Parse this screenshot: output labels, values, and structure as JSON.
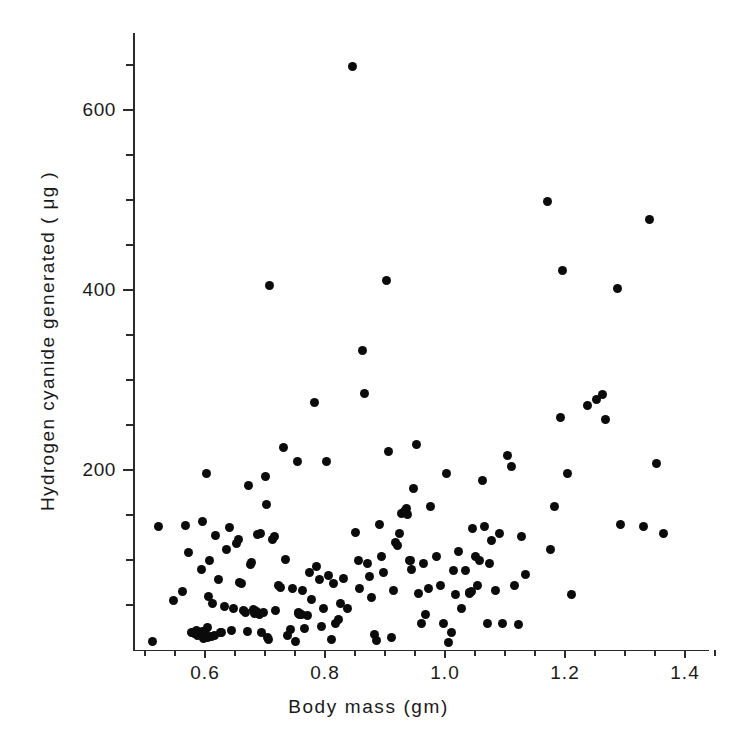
{
  "chart_data": {
    "type": "scatter",
    "title": "",
    "xlabel": "Body mass (gm)",
    "ylabel": "Hydrogen cyanide generated ( μg )",
    "xlim": [
      0.49,
      1.455
    ],
    "ylim": [
      0,
      686
    ],
    "grid": false,
    "legend": null,
    "x_ticks_major": [
      0.6,
      0.8,
      1.0,
      1.2,
      1.4
    ],
    "x_tick_labels": [
      "0.6",
      "0.8",
      "1.0",
      "1.2",
      "1.4"
    ],
    "x_ticks_minor": [
      0.5,
      0.55,
      0.65,
      0.7,
      0.75,
      0.85,
      0.9,
      0.95,
      1.05,
      1.1,
      1.15,
      1.25,
      1.3,
      1.35,
      1.45
    ],
    "y_ticks_major": [
      200,
      400,
      600
    ],
    "y_tick_labels": [
      "200",
      "400",
      "600"
    ],
    "y_ticks_minor": [
      50,
      100,
      150,
      250,
      300,
      350,
      450,
      500,
      550,
      650
    ],
    "marker": "filled-circle",
    "marker_color": "#0b0b0b",
    "marker_size_px": 9,
    "n_points": 176,
    "points": [
      [
        0.513,
        10
      ],
      [
        0.523,
        137
      ],
      [
        0.547,
        55
      ],
      [
        0.562,
        65
      ],
      [
        0.568,
        138
      ],
      [
        0.572,
        108
      ],
      [
        0.578,
        20
      ],
      [
        0.583,
        18
      ],
      [
        0.585,
        22
      ],
      [
        0.588,
        16
      ],
      [
        0.592,
        20
      ],
      [
        0.594,
        90
      ],
      [
        0.596,
        143
      ],
      [
        0.598,
        13
      ],
      [
        0.6,
        18
      ],
      [
        0.602,
        196
      ],
      [
        0.604,
        25
      ],
      [
        0.606,
        60
      ],
      [
        0.608,
        100
      ],
      [
        0.61,
        15
      ],
      [
        0.612,
        52
      ],
      [
        0.615,
        16
      ],
      [
        0.618,
        127
      ],
      [
        0.622,
        78
      ],
      [
        0.628,
        20
      ],
      [
        0.632,
        48
      ],
      [
        0.636,
        112
      ],
      [
        0.64,
        136
      ],
      [
        0.644,
        22
      ],
      [
        0.648,
        46
      ],
      [
        0.652,
        118
      ],
      [
        0.656,
        123
      ],
      [
        0.66,
        74
      ],
      [
        0.664,
        44
      ],
      [
        0.668,
        42
      ],
      [
        0.67,
        21
      ],
      [
        0.672,
        183
      ],
      [
        0.676,
        95
      ],
      [
        0.678,
        97
      ],
      [
        0.68,
        45
      ],
      [
        0.684,
        43
      ],
      [
        0.688,
        128
      ],
      [
        0.69,
        40
      ],
      [
        0.692,
        130
      ],
      [
        0.694,
        20
      ],
      [
        0.697,
        42
      ],
      [
        0.7,
        193
      ],
      [
        0.702,
        162
      ],
      [
        0.704,
        14
      ],
      [
        0.706,
        12
      ],
      [
        0.708,
        405
      ],
      [
        0.712,
        123
      ],
      [
        0.716,
        126
      ],
      [
        0.718,
        44
      ],
      [
        0.722,
        72
      ],
      [
        0.726,
        70
      ],
      [
        0.73,
        225
      ],
      [
        0.734,
        101
      ],
      [
        0.738,
        16
      ],
      [
        0.742,
        23
      ],
      [
        0.746,
        68
      ],
      [
        0.75,
        10
      ],
      [
        0.754,
        210
      ],
      [
        0.756,
        42
      ],
      [
        0.758,
        40
      ],
      [
        0.762,
        66
      ],
      [
        0.766,
        24
      ],
      [
        0.77,
        38
      ],
      [
        0.774,
        86
      ],
      [
        0.778,
        56
      ],
      [
        0.782,
        275
      ],
      [
        0.786,
        93
      ],
      [
        0.79,
        78
      ],
      [
        0.794,
        26
      ],
      [
        0.798,
        46
      ],
      [
        0.802,
        210
      ],
      [
        0.806,
        83
      ],
      [
        0.81,
        12
      ],
      [
        0.814,
        74
      ],
      [
        0.818,
        30
      ],
      [
        0.822,
        34
      ],
      [
        0.826,
        52
      ],
      [
        0.83,
        80
      ],
      [
        0.838,
        46
      ],
      [
        0.845,
        648
      ],
      [
        0.85,
        131
      ],
      [
        0.855,
        100
      ],
      [
        0.858,
        68
      ],
      [
        0.862,
        333
      ],
      [
        0.866,
        285
      ],
      [
        0.87,
        96
      ],
      [
        0.874,
        82
      ],
      [
        0.878,
        58
      ],
      [
        0.882,
        17
      ],
      [
        0.886,
        11
      ],
      [
        0.89,
        139
      ],
      [
        0.894,
        104
      ],
      [
        0.898,
        86
      ],
      [
        0.902,
        411
      ],
      [
        0.906,
        221
      ],
      [
        0.91,
        14
      ],
      [
        0.914,
        66
      ],
      [
        0.918,
        119
      ],
      [
        0.92,
        116
      ],
      [
        0.924,
        130
      ],
      [
        0.928,
        152
      ],
      [
        0.932,
        154
      ],
      [
        0.936,
        157
      ],
      [
        0.94,
        100
      ],
      [
        0.944,
        90
      ],
      [
        0.948,
        180
      ],
      [
        0.952,
        228
      ],
      [
        0.956,
        63
      ],
      [
        0.96,
        30
      ],
      [
        0.964,
        96
      ],
      [
        0.968,
        40
      ],
      [
        0.972,
        68
      ],
      [
        0.976,
        160
      ],
      [
        0.985,
        104
      ],
      [
        0.992,
        72
      ],
      [
        0.998,
        30
      ],
      [
        1.002,
        196
      ],
      [
        1.006,
        8
      ],
      [
        1.01,
        20
      ],
      [
        1.014,
        88
      ],
      [
        1.018,
        62
      ],
      [
        1.022,
        110
      ],
      [
        1.028,
        46
      ],
      [
        1.034,
        88
      ],
      [
        1.04,
        64
      ],
      [
        1.046,
        135
      ],
      [
        1.05,
        104
      ],
      [
        1.054,
        72
      ],
      [
        1.058,
        100
      ],
      [
        1.062,
        188
      ],
      [
        1.066,
        137
      ],
      [
        1.07,
        30
      ],
      [
        1.074,
        96
      ],
      [
        1.078,
        122
      ],
      [
        1.084,
        66
      ],
      [
        1.09,
        129
      ],
      [
        1.096,
        30
      ],
      [
        1.104,
        216
      ],
      [
        1.11,
        204
      ],
      [
        1.116,
        72
      ],
      [
        1.122,
        28
      ],
      [
        1.128,
        126
      ],
      [
        1.134,
        84
      ],
      [
        1.17,
        498
      ],
      [
        1.176,
        112
      ],
      [
        1.182,
        160
      ],
      [
        1.192,
        258
      ],
      [
        1.196,
        422
      ],
      [
        1.204,
        196
      ],
      [
        1.21,
        62
      ],
      [
        1.238,
        272
      ],
      [
        1.252,
        278
      ],
      [
        1.262,
        284
      ],
      [
        1.268,
        256
      ],
      [
        1.288,
        402
      ],
      [
        1.292,
        140
      ],
      [
        1.33,
        137
      ],
      [
        1.34,
        478
      ],
      [
        1.352,
        207
      ],
      [
        1.364,
        130
      ],
      [
        0.586,
        19
      ],
      [
        0.59,
        17
      ],
      [
        0.596,
        21
      ],
      [
        0.604,
        14
      ],
      [
        0.682,
        41
      ],
      [
        0.686,
        43
      ],
      [
        0.93,
        153
      ],
      [
        0.934,
        155
      ],
      [
        0.756,
        41
      ],
      [
        0.76,
        39
      ],
      [
        1.04,
        63
      ],
      [
        1.044,
        65
      ],
      [
        0.938,
        151
      ],
      [
        0.942,
        99
      ],
      [
        0.626,
        19
      ],
      [
        0.658,
        75
      ]
    ]
  },
  "axes": {
    "x_title": "Body mass (gm)",
    "y_title": "Hydrogen cyanide generated ( μg )",
    "x_tick_labels": [
      "0.6",
      "0.8",
      "1.0",
      "1.2",
      "1.4"
    ],
    "y_tick_labels": [
      "600",
      "400",
      "200"
    ]
  },
  "style": {
    "background": "#ffffff",
    "axis_color": "#2b2b2b",
    "marker_color": "#0b0b0b",
    "text_color": "#1a1a1a"
  }
}
